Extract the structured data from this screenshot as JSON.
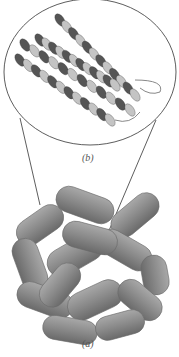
{
  "figure": {
    "panels": [
      {
        "id": "b",
        "label": "(b)",
        "depiction": "helix bundle subunit ribbon model (magnified inset)"
      },
      {
        "id": "a",
        "label": "(a)",
        "depiction": "assembled cage of capsule-shaped subunits"
      }
    ],
    "colors": {
      "subunit_fill": "#8a8a8a",
      "subunit_shade": "#6a6a6a",
      "subunit_highlight": "#a8a8a8",
      "helix_dark": "#555555",
      "helix_light": "#c4c4c4",
      "outline": "#333333"
    }
  }
}
